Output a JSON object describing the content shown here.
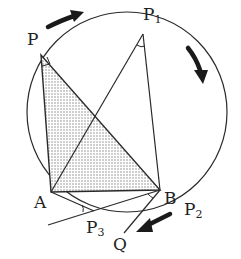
{
  "diagram": {
    "type": "geometry-inscribed-angles",
    "labels": {
      "P": "P",
      "P1": "P",
      "P1_sub": "1",
      "P2": "P",
      "P2_sub": "2",
      "P3": "P",
      "P3_sub": "3",
      "A": "A",
      "B": "B",
      "Q": "Q"
    },
    "points": {
      "P": [
        41,
        55
      ],
      "P1": [
        143,
        34
      ],
      "A": [
        51,
        192
      ],
      "B": [
        160,
        190
      ],
      "P3": [
        94,
        211
      ],
      "Q": [
        124,
        233
      ]
    },
    "circle": {
      "cx": 127,
      "cy": 112,
      "r": 100
    },
    "shaded_triangle": [
      "P",
      "A",
      "B"
    ],
    "colors": {
      "stroke": "#2a2a2a",
      "shade": "#9a9a9a",
      "arrow": "#1a1a1a"
    }
  }
}
